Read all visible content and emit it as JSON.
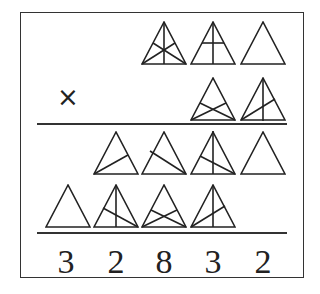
{
  "puzzle": {
    "operator": "×",
    "rows": [
      {
        "name": "multiplicand",
        "cells": [
          null,
          null,
          "all-medians",
          "median-plus-midline",
          "plain"
        ]
      },
      {
        "name": "multiplier",
        "cells": [
          null,
          null,
          null,
          "two-cevians-crossing",
          "median-plus-left-cevian"
        ]
      },
      {
        "name": "partial-product-1",
        "cells": [
          null,
          "left-cevian",
          "right-cevian",
          "median-plus-right-cevian",
          "plain"
        ]
      },
      {
        "name": "partial-product-2",
        "cells": [
          "plain",
          "median-plus-right-cevian",
          "two-cevians-crossing",
          "median-plus-left-cevian",
          null
        ]
      }
    ],
    "result_digits": [
      "3",
      "2",
      "8",
      "3",
      "2"
    ]
  }
}
